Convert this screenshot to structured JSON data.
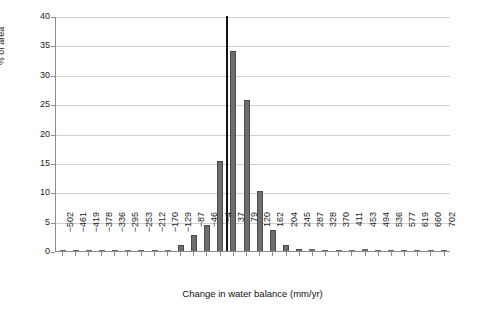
{
  "chart_data": {
    "type": "bar",
    "title": "",
    "xlabel": "Change in water balance (mm/yr)",
    "ylabel": "% of area",
    "ylim": [
      0,
      40
    ],
    "ytick_values": [
      0,
      5,
      10,
      15,
      20,
      25,
      30,
      35,
      40
    ],
    "ytick_labels": [
      "0",
      "5",
      "10",
      "15",
      "20",
      "25",
      "30",
      "35",
      "40"
    ],
    "grid": "horizontal",
    "legend": "none",
    "categories": [
      "-502",
      "-461",
      "-419",
      "-378",
      "-336",
      "-295",
      "-253",
      "-212",
      "-170",
      "-129",
      "-87",
      "-46",
      "-4",
      "37",
      "79",
      "120",
      "162",
      "204",
      "245",
      "287",
      "328",
      "370",
      "411",
      "453",
      "494",
      "536",
      "577",
      "619",
      "660",
      "702"
    ],
    "values": [
      0.05,
      0.05,
      0.05,
      0.05,
      0.05,
      0.1,
      0.1,
      0.15,
      0.2,
      1.0,
      2.8,
      4.4,
      15.3,
      34.0,
      25.7,
      10.2,
      3.6,
      1.0,
      0.4,
      0.3,
      0.25,
      0.25,
      0.2,
      0.3,
      0.25,
      0.2,
      0.2,
      0.2,
      0.15,
      0.1
    ],
    "annotations": [
      {
        "name": "peak-marker",
        "value": 40.0,
        "between_categories": [
          "-4",
          "37"
        ],
        "style": "narrow black bar"
      }
    ],
    "series_color": "#6e6e6e",
    "marker_color": "#111111",
    "grid_color": "#d0d0d0",
    "axis_color": "#8c8c8c"
  }
}
